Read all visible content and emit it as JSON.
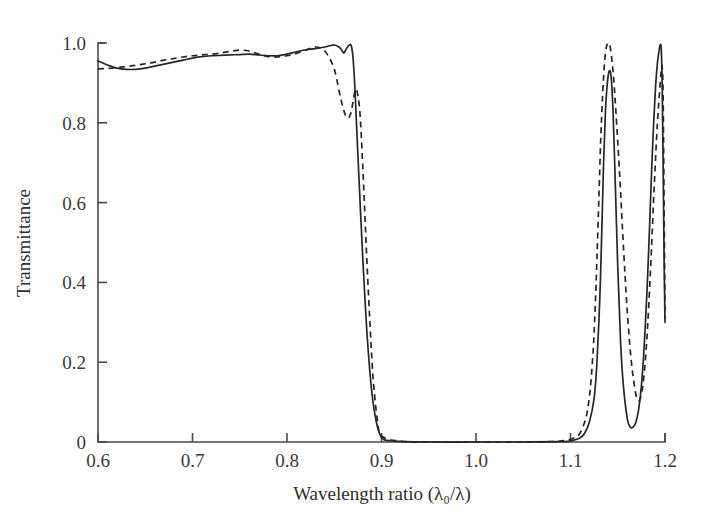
{
  "chart_data": {
    "type": "line",
    "title": "",
    "xlabel": "Wavelength ratio (λ₀/λ)",
    "ylabel": "Transmittance",
    "xlim": [
      0.6,
      1.2
    ],
    "ylim": [
      0.0,
      1.0
    ],
    "grid": false,
    "legend_position": "none",
    "xticks": [
      0.6,
      0.7,
      0.8,
      0.9,
      1.0,
      1.1,
      1.2
    ],
    "xtick_labels": [
      "0.6",
      "0.7",
      "0.8",
      "0.9",
      "1.0",
      "1.1",
      "1.2"
    ],
    "yticks": [
      0.0,
      0.2,
      0.4,
      0.6,
      0.8,
      1.0
    ],
    "ytick_labels": [
      "0",
      "0.2",
      "0.4",
      "0.6",
      "0.8",
      "1.0"
    ],
    "series": [
      {
        "name": "solid",
        "style": "solid",
        "color": "#262626",
        "x": [
          0.6,
          0.61,
          0.62,
          0.63,
          0.64,
          0.65,
          0.66,
          0.67,
          0.68,
          0.69,
          0.7,
          0.71,
          0.72,
          0.73,
          0.74,
          0.75,
          0.76,
          0.77,
          0.78,
          0.79,
          0.8,
          0.81,
          0.82,
          0.83,
          0.84,
          0.845,
          0.85,
          0.855,
          0.858,
          0.86,
          0.862,
          0.864,
          0.866,
          0.868,
          0.87,
          0.872,
          0.875,
          0.88,
          0.885,
          0.89,
          0.895,
          0.9,
          0.91,
          0.95,
          1.0,
          1.05,
          1.09,
          1.1,
          1.11,
          1.115,
          1.12,
          1.125,
          1.128,
          1.131,
          1.133,
          1.135,
          1.137,
          1.139,
          1.141,
          1.143,
          1.145,
          1.147,
          1.15,
          1.153,
          1.156,
          1.16,
          1.163,
          1.166,
          1.169,
          1.172,
          1.175,
          1.178,
          1.181,
          1.184,
          1.186,
          1.188,
          1.19,
          1.192,
          1.194,
          1.195,
          1.196,
          1.197,
          1.198,
          1.199,
          1.2
        ],
        "y": [
          0.955,
          0.945,
          0.937,
          0.934,
          0.934,
          0.937,
          0.942,
          0.947,
          0.952,
          0.957,
          0.962,
          0.966,
          0.968,
          0.969,
          0.97,
          0.971,
          0.972,
          0.97,
          0.968,
          0.968,
          0.972,
          0.978,
          0.983,
          0.986,
          0.99,
          0.993,
          0.995,
          0.99,
          0.982,
          0.975,
          0.982,
          0.99,
          0.995,
          0.993,
          0.96,
          0.88,
          0.72,
          0.47,
          0.26,
          0.12,
          0.045,
          0.012,
          0.003,
          0.0,
          0.0,
          0.0,
          0.001,
          0.003,
          0.01,
          0.022,
          0.05,
          0.11,
          0.2,
          0.36,
          0.52,
          0.7,
          0.83,
          0.9,
          0.93,
          0.915,
          0.83,
          0.68,
          0.44,
          0.25,
          0.14,
          0.06,
          0.038,
          0.037,
          0.048,
          0.08,
          0.14,
          0.24,
          0.38,
          0.56,
          0.69,
          0.8,
          0.89,
          0.95,
          0.985,
          0.996,
          0.985,
          0.9,
          0.7,
          0.47,
          0.3
        ]
      },
      {
        "name": "dashed",
        "style": "dashed",
        "color": "#262626",
        "x": [
          0.6,
          0.61,
          0.62,
          0.63,
          0.64,
          0.65,
          0.66,
          0.67,
          0.68,
          0.69,
          0.7,
          0.71,
          0.72,
          0.73,
          0.74,
          0.75,
          0.76,
          0.77,
          0.78,
          0.79,
          0.8,
          0.81,
          0.82,
          0.825,
          0.83,
          0.835,
          0.84,
          0.845,
          0.85,
          0.853,
          0.856,
          0.859,
          0.862,
          0.864,
          0.866,
          0.868,
          0.87,
          0.872,
          0.874,
          0.877,
          0.88,
          0.885,
          0.89,
          0.893,
          0.896,
          0.9,
          0.92,
          0.96,
          1.0,
          1.05,
          1.08,
          1.095,
          1.105,
          1.11,
          1.115,
          1.118,
          1.121,
          1.124,
          1.126,
          1.128,
          1.13,
          1.132,
          1.134,
          1.136,
          1.138,
          1.14,
          1.142,
          1.145,
          1.148,
          1.152,
          1.156,
          1.16,
          1.164,
          1.168,
          1.171,
          1.174,
          1.177,
          1.18,
          1.183,
          1.186,
          1.188,
          1.19,
          1.192,
          1.194,
          1.196,
          1.197,
          1.198,
          1.199,
          1.2
        ],
        "y": [
          0.935,
          0.936,
          0.938,
          0.941,
          0.944,
          0.948,
          0.952,
          0.957,
          0.961,
          0.965,
          0.968,
          0.97,
          0.972,
          0.975,
          0.979,
          0.982,
          0.98,
          0.972,
          0.966,
          0.965,
          0.968,
          0.974,
          0.982,
          0.987,
          0.99,
          0.988,
          0.98,
          0.962,
          0.935,
          0.905,
          0.87,
          0.84,
          0.818,
          0.812,
          0.815,
          0.828,
          0.855,
          0.88,
          0.88,
          0.83,
          0.7,
          0.43,
          0.2,
          0.11,
          0.05,
          0.015,
          0.002,
          0.0,
          0.0,
          0.0,
          0.001,
          0.004,
          0.012,
          0.022,
          0.05,
          0.08,
          0.135,
          0.23,
          0.33,
          0.46,
          0.61,
          0.76,
          0.87,
          0.95,
          0.99,
          1.0,
          0.99,
          0.93,
          0.83,
          0.67,
          0.49,
          0.33,
          0.21,
          0.135,
          0.105,
          0.11,
          0.15,
          0.23,
          0.35,
          0.5,
          0.61,
          0.71,
          0.8,
          0.87,
          0.93,
          0.94,
          0.87,
          0.6,
          0.31
        ]
      }
    ]
  }
}
